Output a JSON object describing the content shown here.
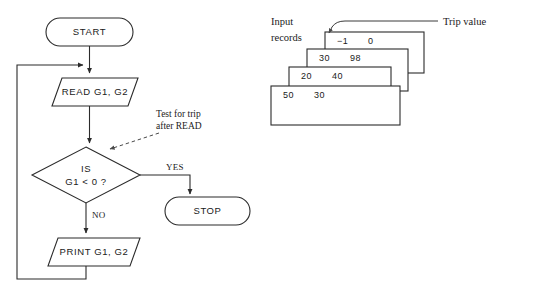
{
  "diagram": {
    "flow": {
      "start_label": "START",
      "read_label": "READ G1, G2",
      "decision_line1": "IS",
      "decision_line2": "G1 < 0 ?",
      "stop_label": "STOP",
      "print_label": "PRINT G1, G2",
      "branch_yes": "YES",
      "branch_no": "NO"
    },
    "annotation": {
      "note_line1": "Test for trip",
      "note_line2": "after READ"
    },
    "records": {
      "label_line1": "Input",
      "label_line2": "records",
      "callout": "Trip value",
      "cards": [
        {
          "field1": "−1",
          "field2": "0"
        },
        {
          "field1": "30",
          "field2": "98"
        },
        {
          "field1": "20",
          "field2": "40"
        },
        {
          "field1": "50",
          "field2": "30"
        }
      ]
    },
    "colors": {
      "stroke": "#2b2b2b",
      "text": "#1a1a1a",
      "background": "#ffffff"
    }
  }
}
